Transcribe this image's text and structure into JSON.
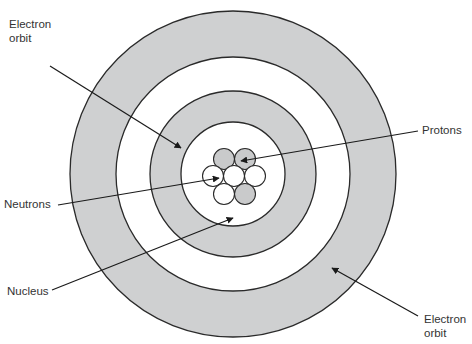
{
  "colors": {
    "shaded_ring": "#cfd0d1",
    "white_ring": "#ffffff",
    "stroke": "#2a2a2a",
    "proton_fill": "#c9cacb",
    "neutron_fill": "#ffffff",
    "text": "#333333"
  },
  "labels": {
    "electron_orbit_top": "Electron\norbit",
    "protons": "Protons",
    "neutrons": "Neutrons",
    "nucleus": "Nucleus",
    "electron_orbit_bottom": "Electron\norbit"
  },
  "geometry": {
    "center": [
      233,
      174
    ],
    "ring_radii": [
      163,
      117,
      83,
      52
    ],
    "particle_radius": 10.5,
    "particles": [
      {
        "type": "proton",
        "x": 224,
        "y": 159
      },
      {
        "type": "proton",
        "x": 245,
        "y": 159
      },
      {
        "type": "neutron",
        "x": 213,
        "y": 176
      },
      {
        "type": "neutron",
        "x": 234,
        "y": 176
      },
      {
        "type": "neutron",
        "x": 255,
        "y": 176
      },
      {
        "type": "neutron",
        "x": 224,
        "y": 194
      },
      {
        "type": "proton",
        "x": 245,
        "y": 194
      }
    ],
    "arrows": [
      {
        "name": "electron-orbit-top",
        "from": [
          50,
          66
        ],
        "to": [
          181,
          148
        ]
      },
      {
        "name": "protons",
        "from": [
          418,
          131
        ],
        "to": [
          241,
          161
        ]
      },
      {
        "name": "neutrons",
        "from": [
          58,
          205
        ],
        "to": [
          219,
          178
        ]
      },
      {
        "name": "nucleus",
        "from": [
          52,
          290
        ],
        "to": [
          233,
          218
        ]
      },
      {
        "name": "electron-orbit-bottom",
        "from": [
          418,
          316
        ],
        "to": [
          332,
          268
        ]
      }
    ]
  }
}
